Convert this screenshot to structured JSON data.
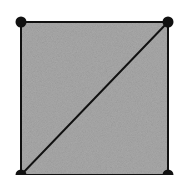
{
  "diagram": {
    "shape": "square",
    "fill_color": "#a9a9a9",
    "stroke_color": "#111111",
    "vertex_color": "#111111",
    "vertices": [
      {
        "id": "top-left"
      },
      {
        "id": "top-right"
      },
      {
        "id": "bottom-right"
      },
      {
        "id": "bottom-left"
      }
    ],
    "edges": [
      {
        "from": "top-left",
        "to": "top-right"
      },
      {
        "from": "top-right",
        "to": "bottom-right"
      },
      {
        "from": "bottom-right",
        "to": "bottom-left"
      },
      {
        "from": "bottom-left",
        "to": "top-left"
      },
      {
        "from": "bottom-left",
        "to": "top-right",
        "type": "diagonal"
      }
    ]
  }
}
